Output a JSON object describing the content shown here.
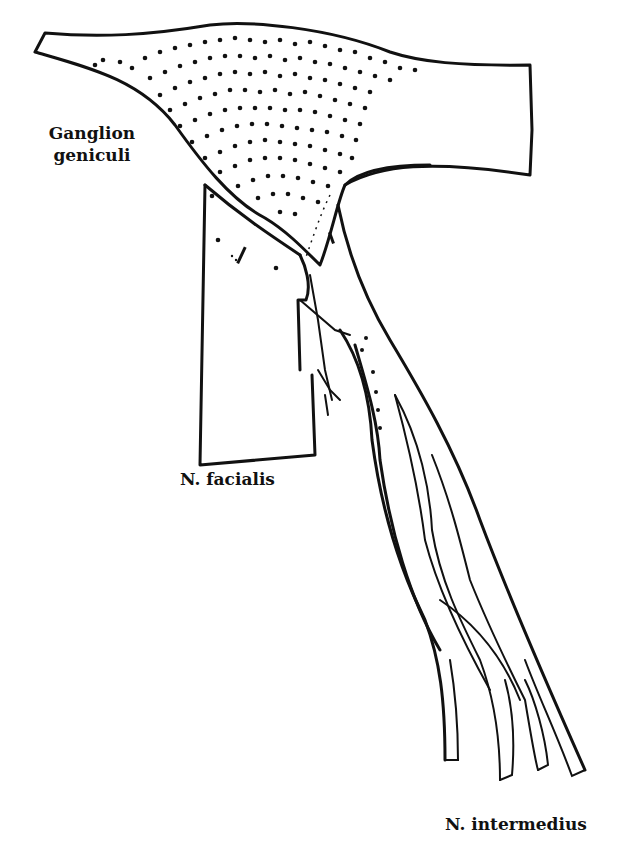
{
  "figure": {
    "labels": {
      "ganglion_line1": "Ganglion",
      "ganglion_line2": "geniculi",
      "facialis": "N. facialis",
      "intermedius": "N. intermedius"
    },
    "colors": {
      "ink": "#111111",
      "paper": "#ffffff"
    }
  }
}
